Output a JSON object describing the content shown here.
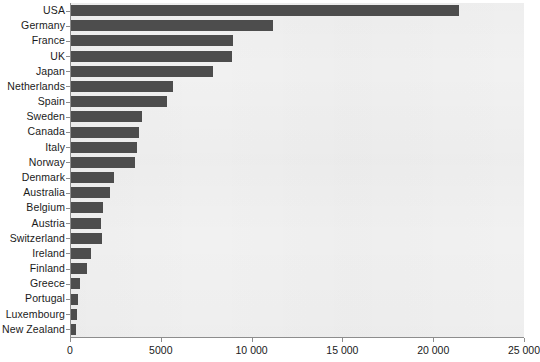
{
  "chart_data": {
    "type": "bar",
    "orientation": "horizontal",
    "title": "",
    "subtitle": "",
    "xlabel": "",
    "ylabel": "",
    "xlim": [
      0,
      25000
    ],
    "ylim": null,
    "grid": false,
    "legend": null,
    "bar_color": "#4d4d4d",
    "plot_background": "#f1f1f1",
    "axis_color": "#8d8d8d",
    "xticks": [
      0,
      5000,
      10000,
      15000,
      20000,
      25000
    ],
    "xtick_labels": [
      "0",
      "5000",
      "10 000",
      "15 000",
      "20 000",
      "25 000"
    ],
    "categories": [
      "USA",
      "Germany",
      "France",
      "UK",
      "Japan",
      "Netherlands",
      "Spain",
      "Sweden",
      "Canada",
      "Italy",
      "Norway",
      "Denmark",
      "Australia",
      "Belgium",
      "Austria",
      "Switzerland",
      "Ireland",
      "Finland",
      "Greece",
      "Portugal",
      "Luxembourg",
      "New Zealand"
    ],
    "values": [
      21400,
      11170,
      8950,
      8900,
      7900,
      5670,
      5330,
      3950,
      3780,
      3670,
      3560,
      2440,
      2220,
      1830,
      1720,
      1780,
      1170,
      950,
      560,
      450,
      400,
      330
    ]
  }
}
